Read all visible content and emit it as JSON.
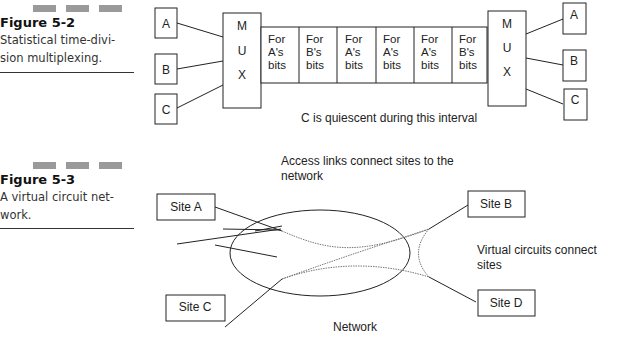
{
  "figures": [
    {
      "title": "Figure 5-2",
      "caption_lines": [
        "Statistical time-divi-",
        "sion multiplexing."
      ]
    },
    {
      "title": "Figure 5-3",
      "caption_lines": [
        "A virtual circuit net-",
        "work."
      ]
    }
  ],
  "tdm_diagram": {
    "left_inputs": [
      "A",
      "B",
      "C"
    ],
    "right_outputs": [
      "A",
      "B",
      "C"
    ],
    "mux_letters": [
      "M",
      "U",
      "X"
    ],
    "slots": [
      {
        "line1": "For",
        "line2": "A's",
        "line3": "bits"
      },
      {
        "line1": "For",
        "line2": "B's",
        "line3": "bits"
      },
      {
        "line1": "For",
        "line2": "A's",
        "line3": "bits"
      },
      {
        "line1": "For",
        "line2": "A's",
        "line3": "bits"
      },
      {
        "line1": "For",
        "line2": "A's",
        "line3": "bits"
      },
      {
        "line1": "For",
        "line2": "B's",
        "line3": "bits"
      }
    ],
    "note": "C is quiescent during this interval"
  },
  "vc_diagram": {
    "sites": {
      "a": "Site A",
      "b": "Site B",
      "c": "Site C",
      "d": "Site D"
    },
    "access_label_line1": "Access links connect sites to the",
    "access_label_line2": "network",
    "vc_label_line1": "Virtual circuits connect",
    "vc_label_line2": "sites",
    "network_label": "Network"
  }
}
